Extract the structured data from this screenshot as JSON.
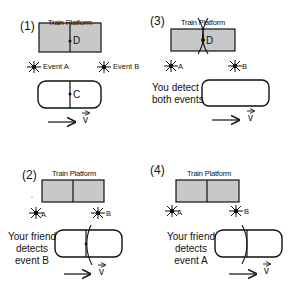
{
  "diagram": {
    "colors": {
      "platform_fill": "#c8c8c8",
      "stroke": "#111111",
      "background": "#ffffff"
    },
    "panels": [
      {
        "id": 1,
        "label": "(1)",
        "platform_title": "Train Platform",
        "platform_point": "D",
        "train_point": "C",
        "event_a": "Event A",
        "event_b": "Event B",
        "velocity": "v",
        "caption": ""
      },
      {
        "id": 3,
        "label": "(3)",
        "platform_title": "Train Platform",
        "platform_point": "D",
        "event_a": "A",
        "event_b": "B",
        "velocity": "v",
        "caption": "You detect\nboth events"
      },
      {
        "id": 2,
        "label": "(2)",
        "platform_title": "Train Platform",
        "event_a": "A",
        "event_b": "B",
        "velocity": "v",
        "caption": "Your friend\ndetects\nevent B"
      },
      {
        "id": 4,
        "label": "(4)",
        "platform_title": "Train Platform",
        "event_a": "A",
        "event_b": "B",
        "velocity": "v",
        "caption": "Your friend\ndetects\nevent A"
      }
    ]
  }
}
